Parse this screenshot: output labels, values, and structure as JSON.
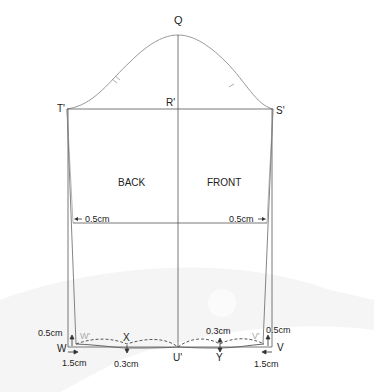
{
  "diagram": {
    "type": "sleeve pattern draft",
    "points": {
      "Q": "Q",
      "R": "R'",
      "S": "S'",
      "T": "T'",
      "U": "U'",
      "V": "V",
      "V_prime": "V'",
      "W": "W",
      "W_prime": "W'",
      "X": "X",
      "Y": "Y"
    },
    "regions": {
      "back": "BACK",
      "front": "FRONT"
    },
    "measurements": {
      "elbow_left": "0.5cm",
      "elbow_right": "0.5cm",
      "wrist_rise_left": "0.5cm",
      "wrist_rise_right": "0.5cm",
      "wrist_in_left": "1.5cm",
      "wrist_in_right": "1.5cm",
      "curve_x": "0.3cm",
      "curve_y": "0.3cm"
    },
    "colors": {
      "line": "#555555",
      "curve": "#999999",
      "faded_label": "#aaaaaa",
      "background_swoosh": "#f3f3f3"
    }
  }
}
